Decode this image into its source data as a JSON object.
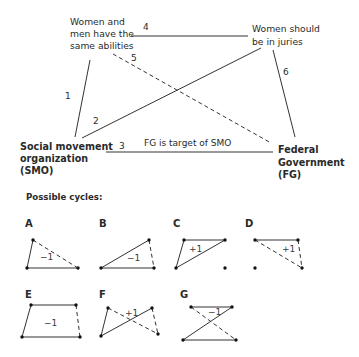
{
  "main_graph": {
    "nodes": {
      "abilities": {
        "lines": [
          "Women and",
          "men have the",
          "same abilities"
        ]
      },
      "juries": {
        "lines": [
          "Women should",
          "be in juries"
        ]
      },
      "smo": {
        "lines": [
          "Social movement",
          "organization",
          "(SMO)"
        ]
      },
      "fg": {
        "lines": [
          "Federal",
          "Government",
          "(FG)"
        ]
      }
    },
    "edges": [
      {
        "id": "1",
        "label": "1",
        "from": "abilities",
        "to": "smo",
        "style": "solid"
      },
      {
        "id": "2",
        "label": "2",
        "from": "smo",
        "to": "juries",
        "style": "solid"
      },
      {
        "id": "3",
        "label": "3",
        "from": "smo",
        "to": "fg",
        "style": "solid",
        "caption": "FG is target of SMO"
      },
      {
        "id": "4",
        "label": "4",
        "from": "abilities",
        "to": "juries",
        "style": "solid"
      },
      {
        "id": "5",
        "label": "5",
        "from": "abilities",
        "to": "fg",
        "style": "dashed"
      },
      {
        "id": "6",
        "label": "6",
        "from": "juries",
        "to": "fg",
        "style": "solid"
      }
    ]
  },
  "cycles_section": {
    "heading": "Possible cycles:",
    "cycles": [
      {
        "letter": "A",
        "sign": "−1"
      },
      {
        "letter": "B",
        "sign": "−1"
      },
      {
        "letter": "C",
        "sign": "+1"
      },
      {
        "letter": "D",
        "sign": "+1"
      },
      {
        "letter": "E",
        "sign": "−1"
      },
      {
        "letter": "F",
        "sign": "+1"
      },
      {
        "letter": "G",
        "sign": "−1"
      }
    ]
  }
}
